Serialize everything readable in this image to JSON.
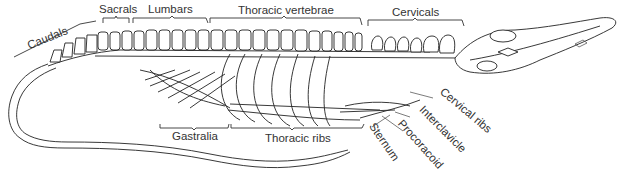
{
  "diagram": {
    "dorsal_labels": [
      {
        "id": "caudals",
        "text": "Caudals"
      },
      {
        "id": "sacrals",
        "text": "Sacrals"
      },
      {
        "id": "lumbars",
        "text": "Lumbars"
      },
      {
        "id": "thoracic_vertebrae",
        "text": "Thoracic vertebrae"
      },
      {
        "id": "cervicals",
        "text": "Cervicals"
      }
    ],
    "ventral_labels": [
      {
        "id": "gastralia",
        "text": "Gastralia"
      },
      {
        "id": "thoracic_ribs",
        "text": "Thoracic ribs"
      }
    ],
    "pointer_labels": [
      {
        "id": "sternum",
        "text": "Sternum"
      },
      {
        "id": "procoracoid",
        "text": "Procoracoid"
      },
      {
        "id": "interclavicle",
        "text": "Interclavicle"
      },
      {
        "id": "cervical_ribs",
        "text": "Cervical ribs"
      }
    ],
    "colors": {
      "line": "#222222",
      "text": "#333333",
      "background": "#ffffff"
    }
  }
}
